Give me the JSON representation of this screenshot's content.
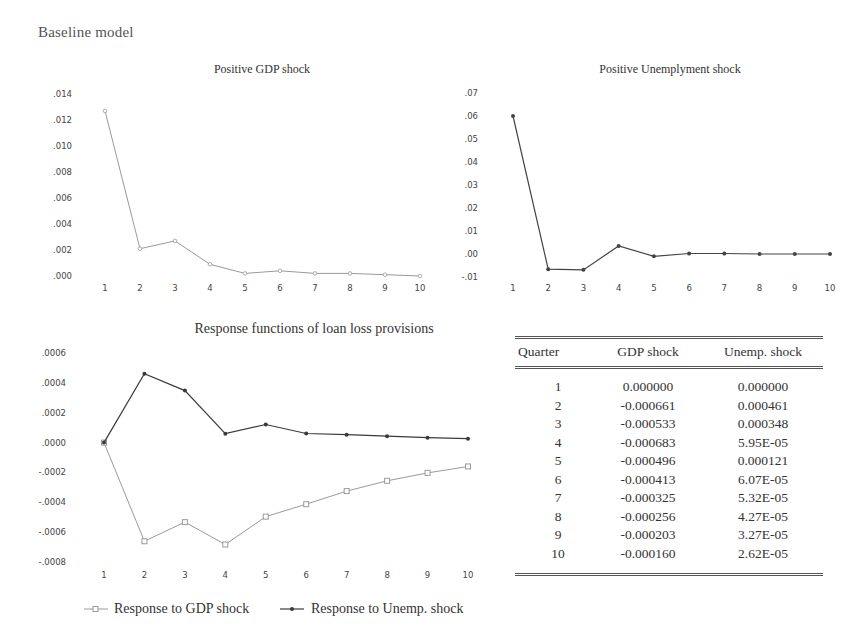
{
  "page": {
    "title": "Baseline model"
  },
  "chart_data": [
    {
      "id": "gdp-shock",
      "type": "line",
      "title": "Positive GDP shock",
      "xlabel": "",
      "ylabel": "",
      "x": [
        1,
        2,
        3,
        4,
        5,
        6,
        7,
        8,
        9,
        10
      ],
      "series": [
        {
          "name": "Positive GDP shock",
          "values": [
            0.0127,
            0.0021,
            0.0027,
            0.0009,
            0.0002,
            0.0004,
            0.0002,
            0.0002,
            0.0001,
            0.0
          ],
          "color": "#9a9a9a",
          "marker": "open-circle"
        }
      ],
      "yticks": [
        ".000",
        ".002",
        ".004",
        ".006",
        ".008",
        ".010",
        ".012",
        ".014"
      ],
      "ylim": [
        0.0,
        0.014
      ],
      "grid": false,
      "legend": null
    },
    {
      "id": "unemp-shock",
      "type": "line",
      "title": "Positive Unemplyment shock",
      "xlabel": "",
      "ylabel": "",
      "x": [
        1,
        2,
        3,
        4,
        5,
        6,
        7,
        8,
        9,
        10
      ],
      "series": [
        {
          "name": "Positive Unemployment shock",
          "values": [
            0.06,
            -0.0066,
            -0.0069,
            0.0035,
            -0.001,
            0.0002,
            0.0002,
            0.0,
            0.0,
            0.0
          ],
          "color": "#444444",
          "marker": "filled-dot"
        }
      ],
      "yticks": [
        "-.01",
        ".00",
        ".01",
        ".02",
        ".03",
        ".04",
        ".05",
        ".06",
        ".07"
      ],
      "ylim": [
        -0.01,
        0.07
      ],
      "grid": false,
      "legend": null
    },
    {
      "id": "llp-response",
      "type": "line",
      "title": "Response functions of loan loss provisions",
      "xlabel": "",
      "ylabel": "",
      "x": [
        1,
        2,
        3,
        4,
        5,
        6,
        7,
        8,
        9,
        10
      ],
      "series": [
        {
          "name": "Response to GDP shock",
          "values": [
            0.0,
            -0.000661,
            -0.000533,
            -0.000683,
            -0.000496,
            -0.000413,
            -0.000325,
            -0.000256,
            -0.000203,
            -0.00016
          ],
          "color": "#9a9a9a",
          "marker": "open-square"
        },
        {
          "name": "Response to Unemp. shock",
          "values": [
            0.0,
            0.000461,
            0.000348,
            5.95e-05,
            0.000121,
            6.07e-05,
            5.32e-05,
            4.27e-05,
            3.27e-05,
            2.62e-05
          ],
          "color": "#3a3a3a",
          "marker": "filled-dot"
        }
      ],
      "yticks": [
        "-.0008",
        "-.0006",
        "-.0004",
        "-.0002",
        ".0000",
        ".0002",
        ".0004",
        ".0006"
      ],
      "ylim": [
        -0.0008,
        0.0006
      ],
      "grid": false,
      "legend": {
        "position": "bottom",
        "entries": [
          "Response to GDP shock",
          "Response to Unemp. shock"
        ]
      }
    },
    {
      "id": "response-table",
      "type": "table",
      "columns": [
        "Quarter",
        "GDP shock",
        "Unemp. shock"
      ],
      "rows": [
        [
          "1",
          "0.000000",
          "0.000000"
        ],
        [
          "2",
          "-0.000661",
          "0.000461"
        ],
        [
          "3",
          "-0.000533",
          "0.000348"
        ],
        [
          "4",
          "-0.000683",
          "5.95E-05"
        ],
        [
          "5",
          "-0.000496",
          "0.000121"
        ],
        [
          "6",
          "-0.000413",
          "6.07E-05"
        ],
        [
          "7",
          "-0.000325",
          "5.32E-05"
        ],
        [
          "8",
          "-0.000256",
          "4.27E-05"
        ],
        [
          "9",
          "-0.000203",
          "3.27E-05"
        ],
        [
          "10",
          "-0.000160",
          "2.62E-05"
        ]
      ]
    }
  ]
}
